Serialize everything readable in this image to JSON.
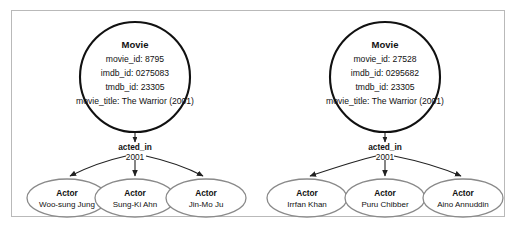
{
  "frame": {
    "border_color": "#b9b9b9",
    "background": "#ffffff"
  },
  "colors": {
    "movie_stroke": "#111111",
    "actor_stroke": "#8a8a8a",
    "edge_stroke": "#222222",
    "text": "#111111"
  },
  "graph": {
    "type": "knowledge-graph",
    "movie_nodes": [
      {
        "label": "Movie",
        "properties": [
          "movie_id: 8795",
          "imdb_id: 0275083",
          "tmdb_id: 23305",
          "movie_title: The Warrior (2001)"
        ],
        "fields": {
          "movie_id": "8795",
          "imdb_id": "0275083",
          "tmdb_id": "23305",
          "movie_title": "The Warrior (2001)"
        }
      },
      {
        "label": "Movie",
        "properties": [
          "movie_id: 27528",
          "imdb_id: 0295682",
          "tmdb_id: 23305",
          "movie_title: The Warrior (2001)"
        ],
        "fields": {
          "movie_id": "27528",
          "imdb_id": "0295682",
          "tmdb_id": "23305",
          "movie_title": "The Warrior (2001)"
        }
      }
    ],
    "relationships": [
      {
        "name": "acted_in",
        "year": "2001"
      },
      {
        "name": "acted_in",
        "year": "2001"
      }
    ],
    "actor_nodes_left": [
      {
        "label": "Actor",
        "name": "Woo-sung Jung"
      },
      {
        "label": "Actor",
        "name": "Sung-Ki Ahn"
      },
      {
        "label": "Actor",
        "name": "Jin-Mo Ju"
      }
    ],
    "actor_nodes_right": [
      {
        "label": "Actor",
        "name": "Irrfan Khan"
      },
      {
        "label": "Actor",
        "name": "Puru Chibber"
      },
      {
        "label": "Actor",
        "name": "Aino Annuddin"
      }
    ]
  }
}
